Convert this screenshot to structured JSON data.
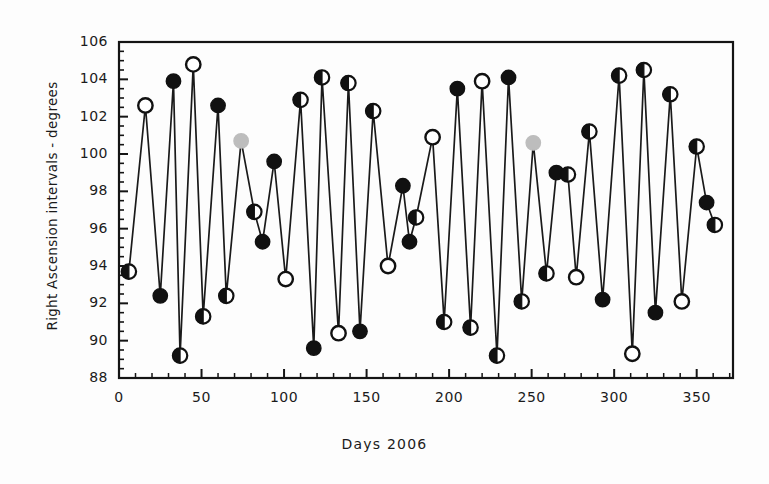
{
  "chart_data": {
    "type": "line",
    "title": "",
    "subtitle": "",
    "xlabel": "Days 2006",
    "ylabel": "Right Ascension intervals - degrees",
    "xlim": [
      0,
      372
    ],
    "ylim": [
      88,
      106
    ],
    "xticks": [
      0,
      50,
      100,
      150,
      200,
      250,
      300,
      350
    ],
    "yticks": [
      88,
      90,
      92,
      94,
      96,
      98,
      100,
      102,
      104,
      106
    ],
    "xtick_labels": [
      "0",
      "50",
      "100",
      "150",
      "200",
      "250",
      "300",
      "350"
    ],
    "ytick_labels": [
      "88",
      "90",
      "92",
      "94",
      "96",
      "98",
      "100",
      "102",
      "104",
      "106"
    ],
    "x_minor_tick_step": 10,
    "y_minor_tick_step": 0.5,
    "grid": false,
    "legend": null,
    "line_color": "#1a1a1a",
    "marker_styles": {
      "filled": "#111111",
      "open": "#ffffff",
      "half": "half-filled-black-white",
      "gray": "#b9b9b9"
    },
    "series": [
      {
        "name": "Right Ascension intervals",
        "points": [
          {
            "x": 6,
            "y": 93.7,
            "marker": "half"
          },
          {
            "x": 16,
            "y": 102.6,
            "marker": "open"
          },
          {
            "x": 25,
            "y": 92.4,
            "marker": "filled"
          },
          {
            "x": 33,
            "y": 103.9,
            "marker": "filled"
          },
          {
            "x": 37,
            "y": 89.2,
            "marker": "half"
          },
          {
            "x": 45,
            "y": 104.8,
            "marker": "open"
          },
          {
            "x": 51,
            "y": 91.3,
            "marker": "half"
          },
          {
            "x": 60,
            "y": 102.6,
            "marker": "filled"
          },
          {
            "x": 65,
            "y": 92.4,
            "marker": "half"
          },
          {
            "x": 74,
            "y": 100.7,
            "marker": "gray"
          },
          {
            "x": 82,
            "y": 96.9,
            "marker": "half"
          },
          {
            "x": 87,
            "y": 95.3,
            "marker": "filled"
          },
          {
            "x": 94,
            "y": 99.6,
            "marker": "filled"
          },
          {
            "x": 101,
            "y": 93.3,
            "marker": "open"
          },
          {
            "x": 110,
            "y": 102.9,
            "marker": "half"
          },
          {
            "x": 118,
            "y": 89.6,
            "marker": "filled"
          },
          {
            "x": 123,
            "y": 104.1,
            "marker": "half"
          },
          {
            "x": 133,
            "y": 90.4,
            "marker": "open"
          },
          {
            "x": 139,
            "y": 103.8,
            "marker": "half"
          },
          {
            "x": 146,
            "y": 90.5,
            "marker": "filled"
          },
          {
            "x": 154,
            "y": 102.3,
            "marker": "half"
          },
          {
            "x": 163,
            "y": 94.0,
            "marker": "open"
          },
          {
            "x": 172,
            "y": 98.3,
            "marker": "filled"
          },
          {
            "x": 176,
            "y": 95.3,
            "marker": "filled"
          },
          {
            "x": 180,
            "y": 96.6,
            "marker": "half"
          },
          {
            "x": 190,
            "y": 100.9,
            "marker": "open"
          },
          {
            "x": 197,
            "y": 91.0,
            "marker": "half"
          },
          {
            "x": 205,
            "y": 103.5,
            "marker": "filled"
          },
          {
            "x": 213,
            "y": 90.7,
            "marker": "half"
          },
          {
            "x": 220,
            "y": 103.9,
            "marker": "open"
          },
          {
            "x": 229,
            "y": 89.2,
            "marker": "half"
          },
          {
            "x": 236,
            "y": 104.1,
            "marker": "filled"
          },
          {
            "x": 244,
            "y": 92.1,
            "marker": "half"
          },
          {
            "x": 251,
            "y": 100.6,
            "marker": "gray"
          },
          {
            "x": 259,
            "y": 93.6,
            "marker": "half"
          },
          {
            "x": 265,
            "y": 99.0,
            "marker": "filled"
          },
          {
            "x": 272,
            "y": 98.9,
            "marker": "half"
          },
          {
            "x": 277,
            "y": 93.4,
            "marker": "open"
          },
          {
            "x": 285,
            "y": 101.2,
            "marker": "half"
          },
          {
            "x": 293,
            "y": 92.2,
            "marker": "filled"
          },
          {
            "x": 303,
            "y": 104.2,
            "marker": "half"
          },
          {
            "x": 311,
            "y": 89.3,
            "marker": "open"
          },
          {
            "x": 318,
            "y": 104.5,
            "marker": "half"
          },
          {
            "x": 325,
            "y": 91.5,
            "marker": "filled"
          },
          {
            "x": 334,
            "y": 103.2,
            "marker": "half"
          },
          {
            "x": 341,
            "y": 92.1,
            "marker": "open"
          },
          {
            "x": 350,
            "y": 100.4,
            "marker": "half"
          },
          {
            "x": 356,
            "y": 97.4,
            "marker": "filled"
          },
          {
            "x": 361,
            "y": 96.2,
            "marker": "half"
          }
        ]
      }
    ]
  }
}
